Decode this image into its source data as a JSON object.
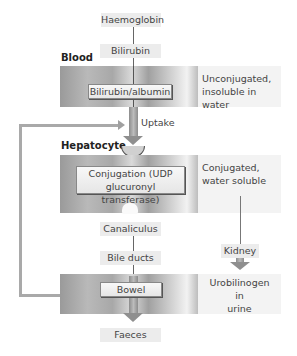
{
  "diagram": {
    "nodes": {
      "haemoglobin": "Haemoglobin",
      "bilirubin": "Bilirubin",
      "bilirubin_albumin": "Bilirubin/albumin",
      "uptake": "Uptake",
      "conjugation_line1": "Conjugation (UDP",
      "conjugation_line2": "glucuronyl transferase)",
      "canaliculus": "Canaliculus",
      "bile_ducts": "Bile ducts",
      "bowel": "Bowel",
      "faeces": "Faeces",
      "kidney": "Kidney"
    },
    "sections": {
      "blood": "Blood",
      "hepatocyte": "Hepatocyte"
    },
    "annotations": {
      "unconjugated_line1": "Unconjugated,",
      "unconjugated_line2": "insoluble in water",
      "conjugated_line1": "Conjugated,",
      "conjugated_line2": "water soluble",
      "urobilinogen_line1": "Urobilinogen",
      "urobilinogen_line2": "in",
      "urobilinogen_line3": "urine"
    },
    "colors": {
      "band_dark": "#9a9a9a",
      "band_light": "#f2f2f2",
      "label_bg": "#ececec",
      "arrow": "#9a9a9a"
    }
  }
}
